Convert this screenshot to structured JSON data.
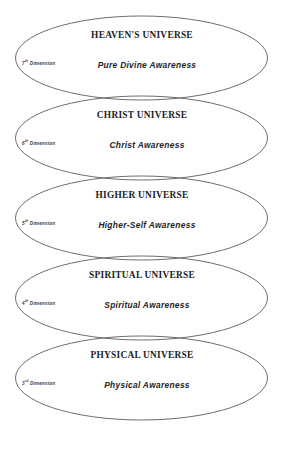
{
  "diagram": {
    "type": "nested-ellipse-hierarchy",
    "stroke_color": "#6e6e70",
    "background_color": "#ffffff",
    "layers": [
      {
        "title": "HEAVEN'S UNIVERSE",
        "subtitle": "Pure Divine Awareness",
        "dimension_number": "7",
        "dimension_ordinal": "th",
        "dimension_label": "Dimension"
      },
      {
        "title": "CHRIST UNIVERSE",
        "subtitle": "Christ Awareness",
        "dimension_number": "6",
        "dimension_ordinal": "th",
        "dimension_label": "Dimension"
      },
      {
        "title": "HIGHER UNIVERSE",
        "subtitle": "Higher-Self Awareness",
        "dimension_number": "5",
        "dimension_ordinal": "th",
        "dimension_label": "Dimension"
      },
      {
        "title": "SPIRITUAL UNIVERSE",
        "subtitle": "Spiritual Awareness",
        "dimension_number": "4",
        "dimension_ordinal": "th",
        "dimension_label": "Dimension"
      },
      {
        "title": "PHYSICAL UNIVERSE",
        "subtitle": "Physical Awareness",
        "dimension_number": "3",
        "dimension_ordinal": "rd",
        "dimension_label": "Dimension"
      }
    ]
  }
}
